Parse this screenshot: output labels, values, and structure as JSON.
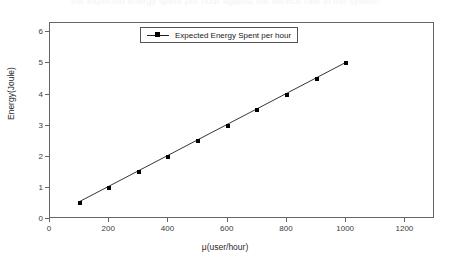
{
  "figure": {
    "caption_remnant": "the expected energy spent per hour against the service rate in the system",
    "background": "#ffffff",
    "frame_color": "#666666"
  },
  "legend": {
    "entries": [
      {
        "label": "Expected Energy Spent per hour",
        "marker": "filled-square",
        "color": "#000000"
      }
    ],
    "position": "top-center"
  },
  "chart_data": {
    "type": "line",
    "title": "",
    "xlabel": "μ(user/hour)",
    "ylabel": "Energy(Joule)",
    "xlim": [
      0,
      1300
    ],
    "ylim": [
      0,
      6.3
    ],
    "xticks": [
      0,
      200,
      400,
      600,
      800,
      1000,
      1200
    ],
    "xticklabels": [
      "0",
      "200",
      "400",
      "600",
      "800",
      "1000",
      "1200"
    ],
    "yticks": [
      0,
      1,
      2,
      3,
      4,
      5,
      6
    ],
    "yticklabels": [
      "0",
      "1",
      "2",
      "3",
      "4",
      "5",
      "6"
    ],
    "grid": false,
    "legend_position": "top-center",
    "series": [
      {
        "name": "Expected Energy Spent per hour",
        "color": "#000000",
        "marker": "filled-square",
        "line_style": "solid",
        "x": [
          100,
          200,
          300,
          400,
          500,
          600,
          700,
          800,
          900,
          1000
        ],
        "values": [
          0.5,
          1.0,
          1.5,
          2.0,
          2.5,
          3.0,
          3.5,
          4.0,
          4.5,
          5.0
        ]
      }
    ]
  }
}
